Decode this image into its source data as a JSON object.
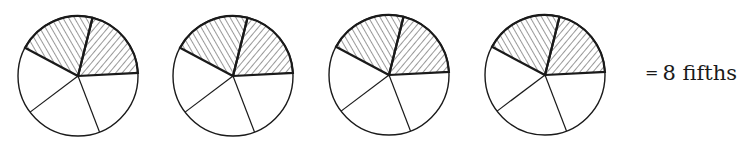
{
  "figure": {
    "circles": [
      {
        "cx": 78,
        "cy": 76,
        "r": 60,
        "parts": 5,
        "shaded": 2
      },
      {
        "cx": 233,
        "cy": 76,
        "r": 60,
        "parts": 5,
        "shaded": 2
      },
      {
        "cx": 389,
        "cy": 75,
        "r": 60,
        "parts": 5,
        "shaded": 2
      },
      {
        "cx": 545,
        "cy": 75,
        "r": 60,
        "parts": 5,
        "shaded": 2
      }
    ],
    "stroke_color": "#1a1a1a",
    "background": "#ffffff"
  },
  "label": {
    "equals": "=",
    "text": "8 fifths"
  }
}
